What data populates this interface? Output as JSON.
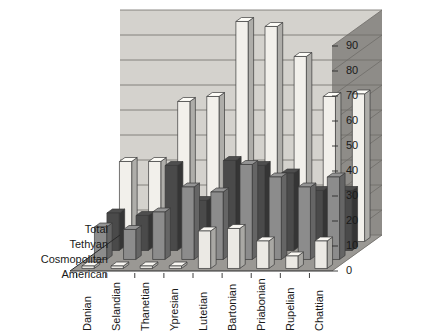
{
  "chart_data": {
    "type": "bar",
    "title": "",
    "subtitle": "",
    "xlabel": "",
    "ylabel": "",
    "zlabel": "",
    "ylim": [
      0,
      90
    ],
    "ytick_step": 10,
    "yticks": [
      "0",
      "10",
      "20",
      "30",
      "40",
      "50",
      "60",
      "70",
      "80",
      "90"
    ],
    "grid": true,
    "legend_position": "depth-axis-labels",
    "projection": "3d-grouped-columns",
    "categories": [
      "Danian",
      "Selandian",
      "Thanetian",
      "Ypresian",
      "Lutetian",
      "Bartonian",
      "Priabonian",
      "Rupelian",
      "Chattian"
    ],
    "series": [
      {
        "name": "Total",
        "color": "#f2f0eb",
        "values": [
          32,
          32,
          56,
          58,
          88,
          86,
          74,
          58,
          59
        ]
      },
      {
        "name": "Tethyan",
        "color": "#4a4a4a",
        "values": [
          15,
          14,
          34,
          20,
          36,
          34,
          31,
          24,
          24
        ]
      },
      {
        "name": "Cosmopolitan",
        "color": "#8c8c8c",
        "values": [
          13,
          12,
          19,
          29,
          27,
          38,
          33,
          29,
          33
        ]
      },
      {
        "name": "American",
        "color": "#ebe9e4",
        "values": [
          1,
          1,
          1,
          1,
          15,
          16,
          11,
          5,
          11
        ]
      }
    ]
  },
  "axis": {
    "y_tick_labels": [
      "90",
      "80",
      "70",
      "60",
      "50",
      "40",
      "30",
      "20",
      "10",
      "0"
    ],
    "z_labels": [
      "Total",
      "Tethyan",
      "Cosmopolitan",
      "American"
    ],
    "x_labels": [
      "Danian",
      "Selandian",
      "Thanetian",
      "Ypresian",
      "Lutetian",
      "Bartonian",
      "Priabonian",
      "Rupelian",
      "Chattian"
    ]
  },
  "colors": {
    "back_wall": "#d4d2cd",
    "side_wall": "#8e8c88",
    "floor": "#9a9894",
    "grid_line": "#6e6c68",
    "bar_total": "#f4f2ed",
    "bar_tethyan": "#4a4a4a",
    "bar_cosmopolitan": "#8c8c8c",
    "bar_american": "#ebe9e4",
    "outline": "#3a3a3a",
    "text": "#1a1a1a"
  }
}
